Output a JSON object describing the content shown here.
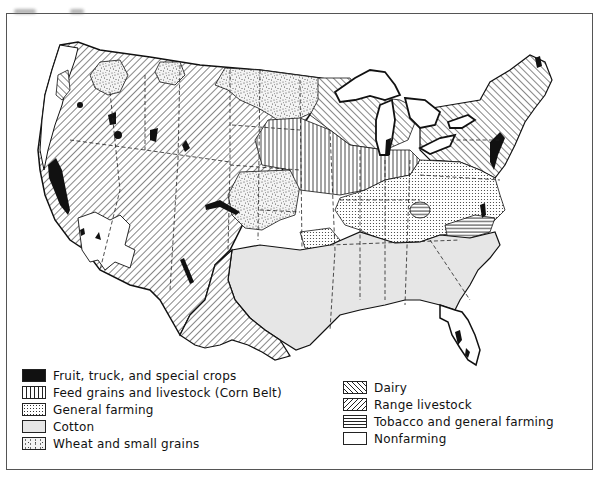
{
  "figure": {
    "type": "thematic map"
  },
  "legend": {
    "left_column": [
      {
        "key": "fruit",
        "label": "Fruit, truck, and special crops",
        "pattern": "solid-black"
      },
      {
        "key": "feed",
        "label": "Feed grains and livestock (Corn Belt)",
        "pattern": "vertical-lines"
      },
      {
        "key": "general",
        "label": "General farming",
        "pattern": "fine-dot-grid"
      },
      {
        "key": "cotton",
        "label": "Cotton",
        "pattern": "light-gray"
      },
      {
        "key": "wheat",
        "label": "Wheat and small grains",
        "pattern": "random-stipple"
      }
    ],
    "right_column": [
      {
        "key": "dairy",
        "label": "Dairy",
        "pattern": "diagonal-backslash"
      },
      {
        "key": "range",
        "label": "Range livestock",
        "pattern": "diagonal-slash"
      },
      {
        "key": "tobacco",
        "label": "Tobacco and general farming",
        "pattern": "horizontal-lines"
      },
      {
        "key": "nonfarming",
        "label": "Nonfarming",
        "pattern": "blank"
      }
    ]
  },
  "colors": {
    "ink": "#1a1a1a",
    "cotton_fill": "#e6e6e6",
    "paper": "#ffffff",
    "frame": "#555555"
  }
}
